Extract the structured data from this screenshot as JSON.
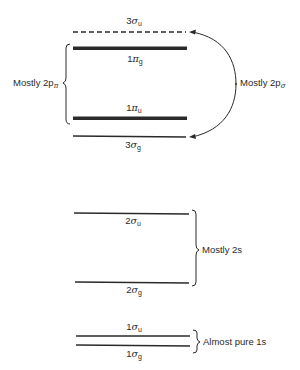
{
  "diagram": {
    "type": "molecular-orbital-energy-levels",
    "levels": [
      {
        "id": "3sigma_u",
        "number": "3",
        "symbol": "σ",
        "sub": "u",
        "style": "dashed",
        "y": 32
      },
      {
        "id": "1pi_g",
        "number": "1",
        "symbol": "π",
        "sub": "g",
        "style": "thick",
        "y": 48
      },
      {
        "id": "1pi_u",
        "number": "1",
        "symbol": "π",
        "sub": "u",
        "style": "thick",
        "y": 118
      },
      {
        "id": "3sigma_g",
        "number": "3",
        "symbol": "σ",
        "sub": "g",
        "style": "thin",
        "y": 136
      },
      {
        "id": "2sigma_u",
        "number": "2",
        "symbol": "σ",
        "sub": "u",
        "style": "thin",
        "y": 213
      },
      {
        "id": "2sigma_g",
        "number": "2",
        "symbol": "σ",
        "sub": "g",
        "style": "thin",
        "y": 282
      },
      {
        "id": "1sigma_u",
        "number": "1",
        "symbol": "σ",
        "sub": "u",
        "style": "thin",
        "y": 336
      },
      {
        "id": "1sigma_g",
        "number": "1",
        "symbol": "σ",
        "sub": "g",
        "style": "thin",
        "y": 345
      }
    ],
    "groups": {
      "pi": {
        "prefix": "Mostly 2p",
        "sub": "π"
      },
      "sigma2p": {
        "prefix": "Mostly 2p",
        "sub": "σ"
      },
      "s2": {
        "text": "Mostly 2s"
      },
      "s1": {
        "text": "Almost pure 1s"
      }
    }
  }
}
